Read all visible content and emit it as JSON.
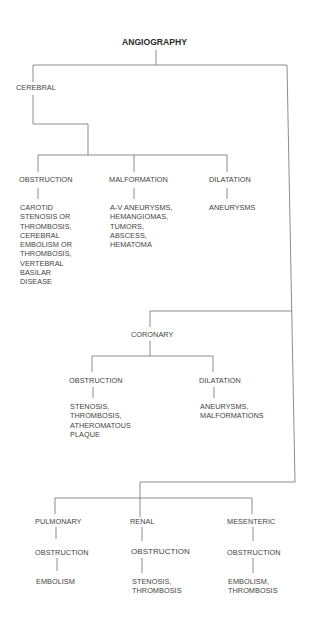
{
  "title": "ANGIOGRAPHY",
  "branches": {
    "cerebral": {
      "label": "CEREBRAL",
      "children": [
        {
          "label": "OBSTRUCTION",
          "detail": "CAROTID\nSTENOSIS OR\nTHROMBOSIS,\nCEREBRAL\nEMBOLISM OR\nTHROMBOSIS,\nVERTEBRAL\nBASILAR\nDISEASE"
        },
        {
          "label": "MALFORMATION",
          "detail": "A-V ANEURYSMS,\nHEMANGIOMAS,\nTUMORS,\nABSCESS,\nHEMATOMA"
        },
        {
          "label": "DILATATION",
          "detail": "ANEURYSMS"
        }
      ]
    },
    "coronary": {
      "label": "CORONARY",
      "children": [
        {
          "label": "OBSTRUCTION",
          "detail": "STENOSIS,\nTHROMBOSIS,\nATHEROMATOUS\nPLAQUE"
        },
        {
          "label": "DILATATION",
          "detail": "ANEURYSMS,\nMALFORMATIONS"
        }
      ]
    },
    "pulmonary": {
      "label": "PULMONARY",
      "child": {
        "label": "OBSTRUCTION",
        "detail": "EMBOLISM"
      }
    },
    "renal": {
      "label": "RENAL",
      "child": {
        "label": "OBSTRUCTION",
        "detail": "STENOSIS,\nTHROMBOSIS"
      }
    },
    "mesenteric": {
      "label": "MESENTERIC",
      "child": {
        "label": "OBSTRUCTION",
        "detail": "EMBOLISM,\nTHROMBOSIS"
      }
    }
  },
  "colors": {
    "line": "#6e6e6e",
    "text": "#444444",
    "background": "#ffffff"
  }
}
